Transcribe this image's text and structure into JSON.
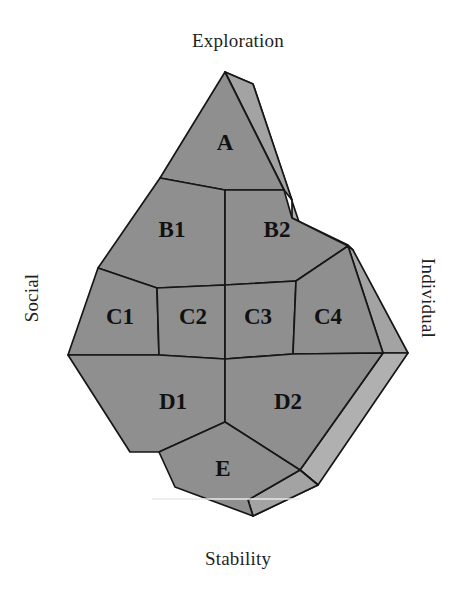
{
  "figure": {
    "type": "gem-quadrant-diagram",
    "shape_description": "three-dimensional faceted gem outline divided into labelled regions",
    "background_color": "#ffffff",
    "face_color": "#8f8f8f",
    "bevel_color": "#a3a3a3",
    "outline_color": "#161616",
    "label_color": "#111111"
  },
  "axes": {
    "top": {
      "name": "axis-label-top",
      "text": "Exploration"
    },
    "bottom": {
      "name": "axis-label-bottom",
      "text": "Stability"
    },
    "left": {
      "name": "axis-label-left",
      "text": "Social",
      "rotation": -90
    },
    "right": {
      "name": "axis-label-right",
      "text": "Individual",
      "rotation": 90
    }
  },
  "regions": [
    {
      "id": "A",
      "label": "A",
      "row": "A",
      "cx": 225,
      "cy": 145
    },
    {
      "id": "B1",
      "label": "B1",
      "row": "B",
      "cx": 172,
      "cy": 232
    },
    {
      "id": "B2",
      "label": "B2",
      "row": "B",
      "cx": 277,
      "cy": 232
    },
    {
      "id": "C1",
      "label": "C1",
      "row": "C",
      "cx": 120,
      "cy": 319
    },
    {
      "id": "C2",
      "label": "C2",
      "row": "C",
      "cx": 193,
      "cy": 319
    },
    {
      "id": "C3",
      "label": "C3",
      "row": "C",
      "cx": 258,
      "cy": 319
    },
    {
      "id": "C4",
      "label": "C4",
      "row": "C",
      "cx": 328,
      "cy": 319
    },
    {
      "id": "D1",
      "label": "D1",
      "row": "D",
      "cx": 173,
      "cy": 404
    },
    {
      "id": "D2",
      "label": "D2",
      "row": "D",
      "cx": 288,
      "cy": 404
    },
    {
      "id": "E",
      "label": "E",
      "row": "E",
      "cx": 223,
      "cy": 471
    }
  ]
}
